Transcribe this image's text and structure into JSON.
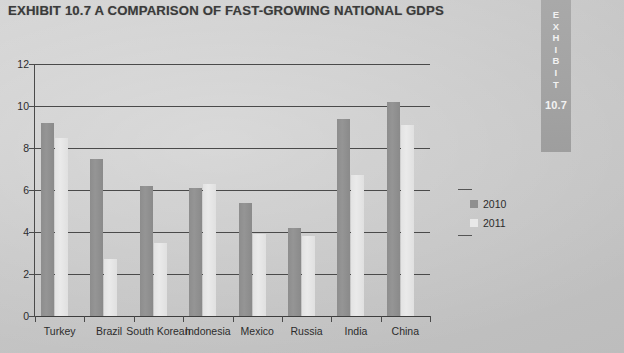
{
  "exhibit": {
    "title": "EXHIBIT 10.7  A COMPARISON OF FAST-GROWING NATIONAL GDPS",
    "tab_word": "EXHIBIT",
    "tab_letters": [
      "E",
      "X",
      "H",
      "I",
      "B",
      "I",
      "T"
    ],
    "tab_number": "10.7"
  },
  "colors": {
    "series_2010": "#8f8f8f",
    "series_2011": "#e8e8e8",
    "grid": "#4a4a4a",
    "text": "#2c2c2c",
    "page_background": "#c9c9c9",
    "tab_background": "#a3a3a3"
  },
  "chart_data": {
    "type": "bar",
    "title": "EXHIBIT 10.7  A COMPARISON OF FAST-GROWING NATIONAL GDPS",
    "xlabel": "",
    "ylabel": "",
    "categories": [
      "Turkey",
      "Brazil",
      "South Korean",
      "Indonesia",
      "Mexico",
      "Russia",
      "India",
      "China"
    ],
    "series": [
      {
        "name": "2010",
        "values": [
          9.2,
          7.5,
          6.2,
          6.1,
          5.4,
          4.2,
          9.4,
          10.2
        ]
      },
      {
        "name": "2011",
        "values": [
          8.5,
          2.7,
          3.5,
          6.3,
          3.9,
          3.8,
          6.7,
          9.1
        ]
      }
    ],
    "ylim": [
      0,
      12
    ],
    "yticks": [
      0,
      2,
      4,
      6,
      8,
      10,
      12
    ],
    "ytick_labels": [
      "0",
      "2",
      "4",
      "6",
      "8",
      "10",
      "12"
    ],
    "grid": true,
    "legend_position": "right"
  }
}
